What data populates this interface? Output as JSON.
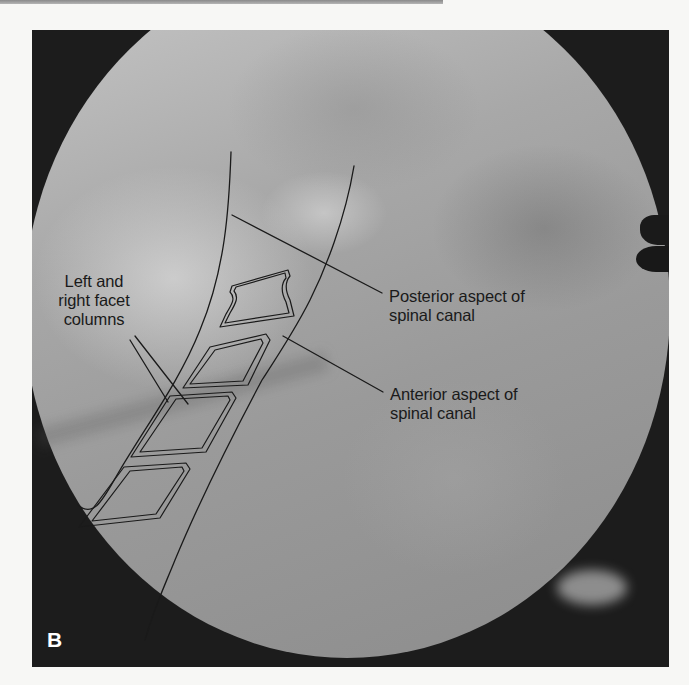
{
  "figure": {
    "panel_letter": "B",
    "image_type": "fluoroscopic radiograph (lateral cervical spine)",
    "frame_color": "#1c1c1c",
    "line_color": "#1a1a1a"
  },
  "annotations": {
    "facet_columns": {
      "line1": "Left and",
      "line2": "right facet",
      "line3": "columns"
    },
    "posterior_canal": {
      "line1": "Posterior aspect of",
      "line2": "spinal canal"
    },
    "anterior_canal": {
      "line1": "Anterior aspect of",
      "line2": "spinal canal"
    }
  }
}
